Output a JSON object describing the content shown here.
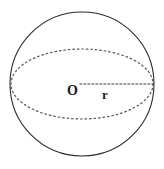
{
  "figure": {
    "name": "sphere-with-great-circle",
    "background_color": "#ffffff",
    "stroke_color": "#2b2b2b",
    "dotted_color": "#5a5a5a",
    "label_color": "#1c1c1c",
    "labels": {
      "center": "O",
      "radius": "r"
    },
    "geometry": {
      "circle": {
        "name": "sphere-outline",
        "center_x": 82,
        "center_y": 84,
        "radius": 72,
        "stroke_width": 1.1,
        "style": "solid"
      },
      "ellipse": {
        "name": "great-circle-equator",
        "center_x": 82,
        "center_y": 84,
        "radius_x": 71,
        "radius_y": 35,
        "stroke_width": 1.2,
        "style": "dotted"
      },
      "radius_line": {
        "name": "radius-segment",
        "x1": 80,
        "y1": 84,
        "x2": 154,
        "y2": 84,
        "stroke_width": 1.2,
        "style": "dotted"
      }
    }
  }
}
